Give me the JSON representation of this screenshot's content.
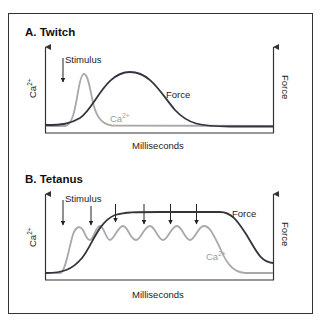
{
  "colors": {
    "force": "#33343f",
    "calcium": "#a9a9a9",
    "axis": "#333333",
    "text": "#222222"
  },
  "panels": [
    {
      "title": "A. Twitch",
      "stimulus_label": "Stimulus",
      "left_axis_label": "Ca",
      "left_axis_sup": "2+",
      "right_axis_label": "Force",
      "x_axis_label": "Milliseconds",
      "force_label": "Force",
      "ca_label": "Ca",
      "ca_label_sup": "2+",
      "stimulus_count": 1
    },
    {
      "title": "B. Tetanus",
      "stimulus_label": "Stimulus",
      "left_axis_label": "Ca",
      "left_axis_sup": "2+",
      "right_axis_label": "Force",
      "x_axis_label": "Milliseconds",
      "force_label": "Force",
      "ca_label": "Ca",
      "ca_label_sup": "2+",
      "stimulus_count": 6
    }
  ]
}
